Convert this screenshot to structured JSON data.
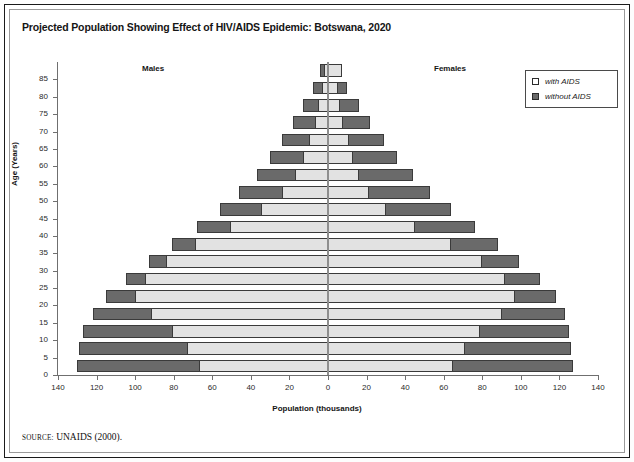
{
  "figure": {
    "title": "Projected Population Showing Effect of HIV/AIDS Epidemic: Botswana, 2020",
    "source_keyword": "SOURCE:",
    "source_text": "UNAIDS (2000).",
    "males_label": "Males",
    "females_label": "Females"
  },
  "legend": {
    "position": "top-right",
    "items": [
      {
        "label": "with AIDS",
        "color": "#ffffff",
        "swatch": "with"
      },
      {
        "label": "without AIDS",
        "color": "#6a6a6a",
        "swatch": "without"
      }
    ]
  },
  "colors": {
    "with_aids_fill": "#e2e2e2",
    "without_aids_fill": "#6a6a6a",
    "bar_outline": "#3a3a3a",
    "axis": "#6f6f6f",
    "text": "#151515"
  },
  "chart_data": {
    "type": "bar",
    "subtype": "population-pyramid",
    "title": "Projected Population Showing Effect of HIV/AIDS Epidemic: Botswana, 2020",
    "xlabel": "Population (thousands)",
    "ylabel": "Age (Years)",
    "xlim": [
      -140,
      140
    ],
    "ylim": [
      0,
      85
    ],
    "x_tick_values": [
      -140,
      -120,
      -100,
      -80,
      -60,
      -40,
      -20,
      0,
      20,
      40,
      60,
      80,
      100,
      120,
      140
    ],
    "x_tick_labels": [
      "140",
      "120",
      "100",
      "80",
      "60",
      "40",
      "20",
      "0",
      "20",
      "40",
      "60",
      "80",
      "100",
      "120",
      "140"
    ],
    "y_tick_labels": [
      "0",
      "5",
      "10",
      "15",
      "20",
      "25",
      "30",
      "35",
      "40",
      "45",
      "50",
      "55",
      "60",
      "65",
      "70",
      "75",
      "80",
      "85"
    ],
    "grid": false,
    "legend_position": "top-right",
    "categories": [
      "0-4",
      "5-9",
      "10-14",
      "15-19",
      "20-24",
      "25-29",
      "30-34",
      "35-39",
      "40-44",
      "45-49",
      "50-54",
      "55-59",
      "60-64",
      "65-69",
      "70-74",
      "75-79",
      "80-84",
      "85+"
    ],
    "series": [
      {
        "name": "with AIDS",
        "side": "males",
        "values": [
          67,
          73,
          81,
          92,
          100,
          95,
          84,
          69,
          51,
          35,
          24,
          17,
          13,
          10,
          7,
          5,
          3,
          2
        ]
      },
      {
        "name": "without AIDS",
        "side": "males",
        "values": [
          130,
          129,
          127,
          122,
          115,
          105,
          93,
          81,
          68,
          56,
          46,
          37,
          30,
          24,
          18,
          13,
          8,
          4
        ]
      },
      {
        "name": "with AIDS",
        "side": "females",
        "values": [
          65,
          71,
          79,
          90,
          97,
          92,
          80,
          64,
          45,
          30,
          21,
          16,
          13,
          11,
          8,
          6,
          5,
          7
        ]
      },
      {
        "name": "without AIDS",
        "side": "females",
        "values": [
          127,
          126,
          125,
          123,
          118,
          110,
          99,
          88,
          76,
          64,
          53,
          44,
          36,
          29,
          22,
          16,
          10,
          4
        ]
      }
    ]
  }
}
